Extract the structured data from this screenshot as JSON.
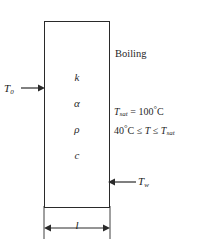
{
  "diagram": {
    "slab": {
      "name": "slab",
      "properties": [
        {
          "key": "conductivity",
          "symbol": "k"
        },
        {
          "key": "diffusivity",
          "symbol": "α"
        },
        {
          "key": "density",
          "symbol": "ρ"
        },
        {
          "key": "specific_heat",
          "symbol": "c"
        }
      ]
    },
    "labels": {
      "boiling": "Boiling",
      "left_temperature": "T",
      "left_temperature_sub": "0",
      "wall_temperature": "T",
      "wall_temperature_sub": "w",
      "thickness": "l"
    },
    "equations": {
      "saturation": {
        "lhs_symbol": "T",
        "lhs_sub": "sat",
        "relation": "=",
        "rhs": "100",
        "degree": "°",
        "unit": "C"
      },
      "range": {
        "lower_value": "40",
        "lower_degree": "°",
        "lower_unit": "C",
        "rel_left": "≤",
        "variable": "T",
        "rel_right": "≤",
        "upper_symbol": "T",
        "upper_sub": "sat"
      }
    },
    "arrows": {
      "inlet_flux": "arrow-right-into-left-face",
      "wall_pointer": "arrow-left-into-right-face",
      "dimension": "double-headed-horizontal-arrow"
    },
    "colors": {
      "stroke": "#2a2a2a",
      "text": "#1f1f1f",
      "background": "#ffffff"
    }
  }
}
